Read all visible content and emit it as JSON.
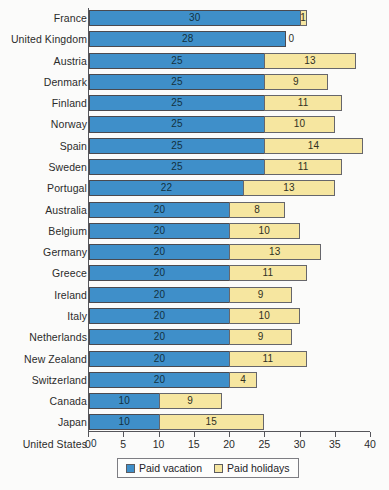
{
  "chart_data": {
    "type": "bar",
    "subtype": "horizontal-stacked-bar",
    "title": "",
    "xlabel": "",
    "ylabel": "",
    "xlim": [
      0,
      40
    ],
    "xticks": [
      0,
      5,
      10,
      15,
      20,
      25,
      30,
      35,
      40
    ],
    "grid": false,
    "legend_position": "bottom-center",
    "categories": [
      "France",
      "United Kingdom",
      "Austria",
      "Denmark",
      "Finland",
      "Norway",
      "Spain",
      "Sweden",
      "Portugal",
      "Australia",
      "Belgium",
      "Germany",
      "Greece",
      "Ireland",
      "Italy",
      "Netherlands",
      "New Zealand",
      "Switzerland",
      "Canada",
      "Japan",
      "United States"
    ],
    "series": [
      {
        "name": "Paid vacation",
        "color": "#3f8fc9",
        "values": [
          30,
          28,
          25,
          25,
          25,
          25,
          25,
          25,
          22,
          20,
          20,
          20,
          20,
          20,
          20,
          20,
          20,
          20,
          10,
          10,
          0
        ]
      },
      {
        "name": "Paid holidays",
        "color": "#f6e6a0",
        "values": [
          1,
          0,
          13,
          9,
          11,
          10,
          14,
          11,
          13,
          8,
          10,
          13,
          11,
          9,
          10,
          9,
          11,
          4,
          9,
          15,
          0
        ]
      }
    ],
    "totals": [
      31,
      28,
      38,
      34,
      36,
      35,
      39,
      36,
      35,
      28,
      30,
      33,
      31,
      29,
      30,
      29,
      31,
      24,
      19,
      25,
      0
    ]
  },
  "legend": {
    "items": [
      {
        "label": "Paid vacation",
        "color": "#3f8fc9"
      },
      {
        "label": "Paid holidays",
        "color": "#f6e6a0"
      }
    ]
  }
}
